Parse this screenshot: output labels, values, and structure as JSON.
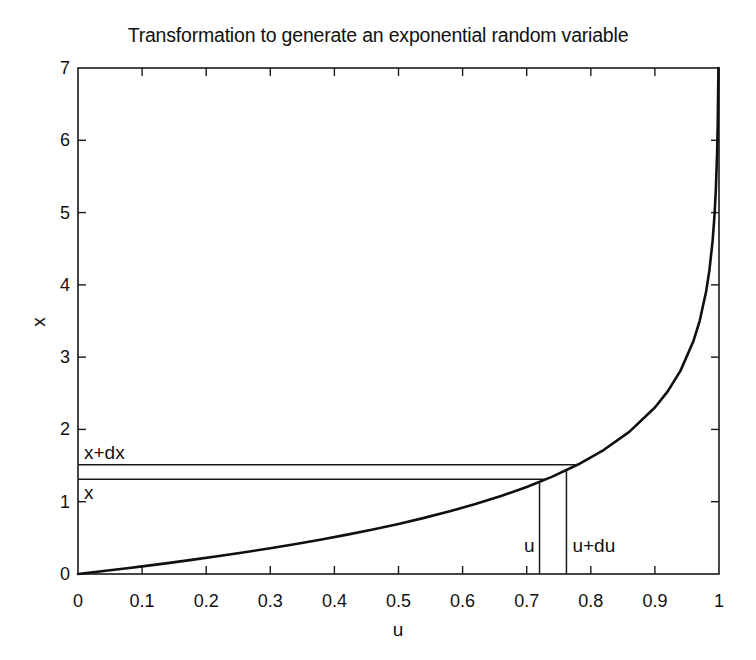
{
  "chart_data": {
    "type": "line",
    "title": "Transformation to generate an exponential random variable",
    "xlabel": "u",
    "ylabel": "x",
    "xlim": [
      0,
      1
    ],
    "ylim": [
      0,
      7
    ],
    "grid": false,
    "legend": null,
    "xticks": [
      "0",
      "0.1",
      "0.2",
      "0.3",
      "0.4",
      "0.5",
      "0.6",
      "0.7",
      "0.8",
      "0.9",
      "1"
    ],
    "xtick_values": [
      0,
      0.1,
      0.2,
      0.3,
      0.4,
      0.5,
      0.6,
      0.7,
      0.8,
      0.9,
      1
    ],
    "yticks": [
      "0",
      "1",
      "2",
      "3",
      "4",
      "5",
      "6",
      "7"
    ],
    "ytick_values": [
      0,
      1,
      2,
      3,
      4,
      5,
      6,
      7
    ],
    "series": [
      {
        "name": "x = -ln(1-u)",
        "x": [
          0,
          0.02,
          0.04,
          0.06,
          0.08,
          0.1,
          0.14,
          0.18,
          0.22,
          0.26,
          0.3,
          0.34,
          0.38,
          0.42,
          0.46,
          0.5,
          0.54,
          0.58,
          0.62,
          0.66,
          0.7,
          0.74,
          0.78,
          0.82,
          0.86,
          0.9,
          0.92,
          0.94,
          0.96,
          0.97,
          0.98,
          0.985,
          0.99,
          0.993,
          0.995,
          0.997,
          0.998,
          0.999,
          0.9991
        ],
        "y": [
          0,
          0.0202,
          0.0408,
          0.0619,
          0.0834,
          0.1054,
          0.1508,
          0.1985,
          0.2485,
          0.3011,
          0.3567,
          0.4155,
          0.478,
          0.5447,
          0.616,
          0.6931,
          0.7765,
          0.8675,
          0.9676,
          1.0788,
          1.204,
          1.3471,
          1.5141,
          1.7148,
          1.9661,
          2.3026,
          2.5257,
          2.8134,
          3.2189,
          3.5066,
          3.912,
          4.1997,
          4.6052,
          4.9618,
          5.2983,
          5.8091,
          6.2146,
          6.9078,
          7.0
        ]
      }
    ],
    "annotations": [
      {
        "name": "x-level",
        "label": "x",
        "type": "hline",
        "value": 1.31,
        "label_side": "below-right"
      },
      {
        "name": "x-plus-dx-level",
        "label": "x+dx",
        "type": "hline",
        "value": 1.51,
        "label_side": "above-right"
      },
      {
        "name": "u-position",
        "label": "u",
        "type": "vline",
        "value": 0.72,
        "label_side": "left"
      },
      {
        "name": "u-plus-du-position",
        "label": "u+du",
        "type": "vline",
        "value": 0.762,
        "label_side": "right"
      }
    ]
  },
  "colors": {
    "background": "#ffffff",
    "axis": "#1a1a1a",
    "curve": "#101010",
    "guide": "#1a1a1a",
    "text": "#111111"
  }
}
